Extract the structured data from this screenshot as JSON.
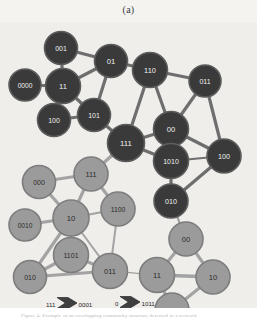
{
  "figure": {
    "panel_label": "(a)",
    "background_color": "#efeeeb",
    "page_background": "#ffffff",
    "cut_off_caption": "Figure 4. Example of an overlapping community structure detected in a network",
    "colors": {
      "dark_node_fill": "#3a3a3a",
      "dark_node_stroke": "#5d5d5d",
      "light_node_fill": "#9b9b9b",
      "light_node_stroke": "#7d7d7d",
      "dark_node_text": "#f0f0f0",
      "light_node_text": "#2b2b2b",
      "edge_dark": "#6e6e6e",
      "edge_light": "#a3a3a3",
      "edge_thin": "#8d8d8d"
    }
  },
  "graph": {
    "nodes": [
      {
        "id": "n01",
        "label": "001",
        "x": 61,
        "y": 26,
        "r": 16.5,
        "group": "dark",
        "font": 7.0
      },
      {
        "id": "n02",
        "label": "0000",
        "x": 25,
        "y": 63,
        "r": 16.0,
        "group": "dark",
        "font": 6.6
      },
      {
        "id": "n03",
        "label": "11",
        "x": 63,
        "y": 64,
        "r": 17.5,
        "group": "dark",
        "font": 7.6
      },
      {
        "id": "n04",
        "label": "01",
        "x": 111,
        "y": 39,
        "r": 16.5,
        "group": "dark",
        "font": 7.6
      },
      {
        "id": "n05",
        "label": "110",
        "x": 150,
        "y": 48,
        "r": 17.5,
        "group": "dark",
        "font": 7.4
      },
      {
        "id": "n06",
        "label": "011",
        "x": 205,
        "y": 59,
        "r": 16.0,
        "group": "dark",
        "font": 7.0
      },
      {
        "id": "n07",
        "label": "100",
        "x": 54,
        "y": 98,
        "r": 16.5,
        "group": "dark",
        "font": 7.0
      },
      {
        "id": "n08",
        "label": "101",
        "x": 94,
        "y": 93,
        "r": 16.5,
        "group": "dark",
        "font": 7.0
      },
      {
        "id": "n09",
        "label": "111",
        "x": 126,
        "y": 121,
        "r": 18.5,
        "group": "dark",
        "font": 7.8
      },
      {
        "id": "n10",
        "label": "00",
        "x": 171,
        "y": 107,
        "r": 17.5,
        "group": "dark",
        "font": 7.6
      },
      {
        "id": "n11",
        "label": "1010",
        "x": 171,
        "y": 139,
        "r": 17.5,
        "group": "dark",
        "font": 7.0
      },
      {
        "id": "n12",
        "label": "100",
        "x": 224,
        "y": 134,
        "r": 17.0,
        "group": "dark",
        "font": 7.2
      },
      {
        "id": "n13",
        "label": "010",
        "x": 171,
        "y": 179,
        "r": 17.0,
        "group": "dark",
        "font": 7.2
      },
      {
        "id": "n14",
        "label": "000",
        "x": 39,
        "y": 160,
        "r": 16.5,
        "group": "light",
        "font": 7.0
      },
      {
        "id": "n15",
        "label": "111",
        "x": 91,
        "y": 152,
        "r": 17.0,
        "group": "light",
        "font": 7.4
      },
      {
        "id": "n16",
        "label": "0010",
        "x": 25,
        "y": 203,
        "r": 16.0,
        "group": "light",
        "font": 6.6
      },
      {
        "id": "n17",
        "label": "10",
        "x": 71,
        "y": 196,
        "r": 18.0,
        "group": "light",
        "font": 7.8
      },
      {
        "id": "n18",
        "label": "1100",
        "x": 118,
        "y": 187,
        "r": 17.0,
        "group": "light",
        "font": 6.8
      },
      {
        "id": "n19",
        "label": "1101",
        "x": 71,
        "y": 233,
        "r": 17.5,
        "group": "light",
        "font": 7.0
      },
      {
        "id": "n20",
        "label": "010",
        "x": 30,
        "y": 255,
        "r": 16.5,
        "group": "light",
        "font": 7.0
      },
      {
        "id": "n21",
        "label": "011",
        "x": 110,
        "y": 249,
        "r": 17.5,
        "group": "light",
        "font": 7.4
      },
      {
        "id": "n22",
        "label": "00",
        "x": 186,
        "y": 217,
        "r": 17.0,
        "group": "light",
        "font": 7.6
      },
      {
        "id": "n23",
        "label": "11",
        "x": 157,
        "y": 253,
        "r": 17.5,
        "group": "light",
        "font": 7.6
      },
      {
        "id": "n24",
        "label": "10",
        "x": 213,
        "y": 255,
        "r": 17.0,
        "group": "light",
        "font": 7.6
      },
      {
        "id": "n25",
        "label": "011",
        "x": 172,
        "y": 288,
        "r": 17.0,
        "group": "light",
        "font": 7.2
      }
    ],
    "edges": [
      {
        "from": "n01",
        "to": "n03",
        "w": 3.2,
        "shade": "dark"
      },
      {
        "from": "n01",
        "to": "n04",
        "w": 3.2,
        "shade": "dark"
      },
      {
        "from": "n02",
        "to": "n03",
        "w": 3.2,
        "shade": "dark"
      },
      {
        "from": "n03",
        "to": "n04",
        "w": 3.2,
        "shade": "dark"
      },
      {
        "from": "n03",
        "to": "n07",
        "w": 3.2,
        "shade": "dark"
      },
      {
        "from": "n03",
        "to": "n08",
        "w": 3.2,
        "shade": "dark"
      },
      {
        "from": "n04",
        "to": "n05",
        "w": 3.2,
        "shade": "dark"
      },
      {
        "from": "n04",
        "to": "n08",
        "w": 3.2,
        "shade": "dark"
      },
      {
        "from": "n05",
        "to": "n06",
        "w": 3.2,
        "shade": "dark"
      },
      {
        "from": "n05",
        "to": "n09",
        "w": 3.2,
        "shade": "dark"
      },
      {
        "from": "n05",
        "to": "n10",
        "w": 3.2,
        "shade": "dark"
      },
      {
        "from": "n06",
        "to": "n10",
        "w": 3.2,
        "shade": "dark"
      },
      {
        "from": "n06",
        "to": "n12",
        "w": 3.2,
        "shade": "dark"
      },
      {
        "from": "n07",
        "to": "n08",
        "w": 3.2,
        "shade": "dark"
      },
      {
        "from": "n08",
        "to": "n09",
        "w": 3.2,
        "shade": "dark"
      },
      {
        "from": "n09",
        "to": "n10",
        "w": 3.2,
        "shade": "dark"
      },
      {
        "from": "n09",
        "to": "n11",
        "w": 3.2,
        "shade": "dark"
      },
      {
        "from": "n10",
        "to": "n11",
        "w": 3.2,
        "shade": "dark"
      },
      {
        "from": "n10",
        "to": "n12",
        "w": 3.2,
        "shade": "dark"
      },
      {
        "from": "n11",
        "to": "n12",
        "w": 2.2,
        "shade": "dark"
      },
      {
        "from": "n11",
        "to": "n13",
        "w": 3.2,
        "shade": "dark"
      },
      {
        "from": "n12",
        "to": "n13",
        "w": 3.2,
        "shade": "dark"
      },
      {
        "from": "n09",
        "to": "n15",
        "w": 3.2,
        "shade": "light"
      },
      {
        "from": "n14",
        "to": "n15",
        "w": 3.2,
        "shade": "light"
      },
      {
        "from": "n14",
        "to": "n17",
        "w": 3.2,
        "shade": "light"
      },
      {
        "from": "n15",
        "to": "n17",
        "w": 3.2,
        "shade": "light"
      },
      {
        "from": "n15",
        "to": "n18",
        "w": 3.2,
        "shade": "light"
      },
      {
        "from": "n16",
        "to": "n17",
        "w": 3.2,
        "shade": "light"
      },
      {
        "from": "n17",
        "to": "n18",
        "w": 2.0,
        "shade": "light"
      },
      {
        "from": "n17",
        "to": "n19",
        "w": 3.2,
        "shade": "light"
      },
      {
        "from": "n17",
        "to": "n20",
        "w": 3.2,
        "shade": "light"
      },
      {
        "from": "n17",
        "to": "n21",
        "w": 2.0,
        "shade": "light"
      },
      {
        "from": "n18",
        "to": "n21",
        "w": 2.0,
        "shade": "light"
      },
      {
        "from": "n19",
        "to": "n20",
        "w": 3.2,
        "shade": "light"
      },
      {
        "from": "n19",
        "to": "n21",
        "w": 3.2,
        "shade": "light"
      },
      {
        "from": "n20",
        "to": "n21",
        "w": 3.2,
        "shade": "light"
      },
      {
        "from": "n21",
        "to": "n23",
        "w": 1.0,
        "shade": "thin"
      },
      {
        "from": "n13",
        "to": "n22",
        "w": 2.2,
        "shade": "light"
      },
      {
        "from": "n22",
        "to": "n23",
        "w": 3.2,
        "shade": "light"
      },
      {
        "from": "n22",
        "to": "n24",
        "w": 3.2,
        "shade": "light"
      },
      {
        "from": "n23",
        "to": "n24",
        "w": 3.6,
        "shade": "light"
      },
      {
        "from": "n23",
        "to": "n25",
        "w": 3.2,
        "shade": "light"
      },
      {
        "from": "n24",
        "to": "n25",
        "w": 3.2,
        "shade": "light"
      }
    ]
  },
  "legend": {
    "arrows": [
      {
        "id": "a1",
        "source": "111",
        "target": "0001",
        "x": 57,
        "y": 281,
        "shade": "dark"
      },
      {
        "id": "a2",
        "source": "0",
        "target": "1011",
        "x": 120,
        "y": 280,
        "shade": "dark"
      },
      {
        "id": "a3",
        "source": "10",
        "target": "0001",
        "x": 62,
        "y": 298,
        "shade": "light"
      },
      {
        "id": "a4",
        "source": "110",
        "target": "000",
        "x": 125,
        "y": 297,
        "shade": "light"
      }
    ]
  }
}
